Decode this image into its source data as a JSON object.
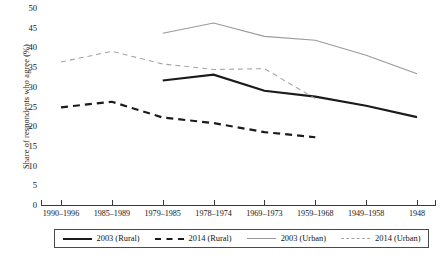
{
  "chart_data": {
    "type": "line",
    "title": "",
    "xlabel": "",
    "ylabel": "Share of respondents who agree (%)",
    "categories": [
      "1990–1996",
      "1985–1989",
      "1979–1985",
      "1978–1974",
      "1969–1973",
      "1959–1968",
      "1949–1958",
      "1948"
    ],
    "ylim": [
      0,
      50
    ],
    "yticks": [
      0,
      5,
      10,
      15,
      20,
      25,
      30,
      35,
      40,
      45,
      50
    ],
    "grid": false,
    "legend_position": "bottom",
    "series": [
      {
        "name": "2003 (Rural)",
        "style": "solid",
        "color": "#1b1b1b",
        "width": 2.2,
        "values": [
          null,
          null,
          31.6,
          33.1,
          29.0,
          27.5,
          25.2,
          22.3
        ]
      },
      {
        "name": "2014 (Rural)",
        "style": "dashed",
        "color": "#1b1b1b",
        "width": 2.2,
        "values": [
          24.8,
          26.2,
          22.2,
          20.8,
          18.5,
          17.2,
          null,
          null
        ]
      },
      {
        "name": "2003 (Urban)",
        "style": "solid",
        "color": "#9a9a9a",
        "width": 1.1,
        "values": [
          null,
          null,
          43.6,
          46.2,
          42.8,
          41.8,
          38.0,
          33.3
        ]
      },
      {
        "name": "2014 (Urban)",
        "style": "dashed",
        "color": "#a5a5a5",
        "width": 1.1,
        "values": [
          36.3,
          39.0,
          35.8,
          34.4,
          34.6,
          27.0,
          null,
          null
        ]
      }
    ]
  },
  "legend": {
    "entries": [
      {
        "label": "2003 (Rural)",
        "swatch": "sw-solid-dark"
      },
      {
        "label": "2014 (Rural)",
        "swatch": "sw-dash-dark"
      },
      {
        "label": "2003 (Urban)",
        "swatch": "sw-solid-gray"
      },
      {
        "label": "2014 (Urban)",
        "swatch": "sw-dash-gray"
      }
    ]
  }
}
